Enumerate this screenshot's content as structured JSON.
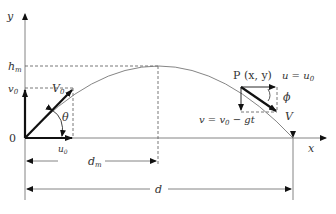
{
  "diagram": {
    "axes": {
      "x_label": "x",
      "y_label": "y",
      "origin_label": "0"
    },
    "y_axis_marks": {
      "h_max": "hm",
      "h_max_sub": "m",
      "v0": "v",
      "v0_sub": "0"
    },
    "launch": {
      "velocity_label": "V",
      "velocity_sub": "0",
      "angle_label": "θ",
      "horizontal_label": "u",
      "horizontal_sub": "0"
    },
    "point": {
      "label": "P (x, y)",
      "u_label": "u = u",
      "u_sub": "0",
      "phi_label": "ϕ",
      "v_label": "v = v",
      "v_sub": "0",
      "v_rest": " − gt",
      "V_label": "V"
    },
    "dimensions": {
      "d_m": "d",
      "d_m_sub": "m",
      "d": "d"
    },
    "colors": {
      "line": "#111111",
      "thin": "#777777",
      "dashed": "#555555"
    }
  }
}
